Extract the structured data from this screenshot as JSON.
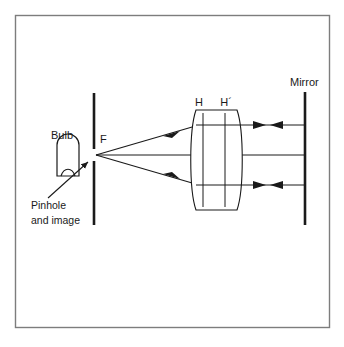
{
  "figure": {
    "background_color": "#ffffff",
    "border_color": "#7d7d7d",
    "line_color": "#1a1a1a",
    "ray_color": "#2b2b2b"
  },
  "labels": {
    "bulb": "Bulb",
    "focal_point": "F",
    "pinhole": "Pinhole",
    "pinhole_line2": "and image",
    "principal_plane_h": "H",
    "principal_plane_h_prime": "H´",
    "mirror": "Mirror"
  },
  "elements": {
    "bulb_icon": "light-bulb",
    "screen_icon": "vertical-screen-bar",
    "lens_icon": "biconvex-lens",
    "mirror_icon": "vertical-mirror-bar",
    "pointer_icon": "callout-arrow",
    "ray_arrow_icon": "arrowhead"
  },
  "geometry": {
    "frame": {
      "x": 15,
      "y": 15,
      "width": 315,
      "height": 313
    },
    "screen": {
      "x": 94,
      "y_top": 93,
      "y_bottom": 225
    },
    "mirror": {
      "x": 305,
      "y_top": 92,
      "y_bottom": 225
    },
    "focal_point": {
      "x": 96,
      "y": 155
    },
    "lens": {
      "x_left": 190,
      "x_right": 243,
      "y_top": 110,
      "y_bottom": 210
    },
    "principal_planes": {
      "h_x": 203,
      "h_prime_x": 225
    },
    "rays": {
      "axis_y": 155,
      "upper_y": 125,
      "lower_y": 185
    }
  }
}
